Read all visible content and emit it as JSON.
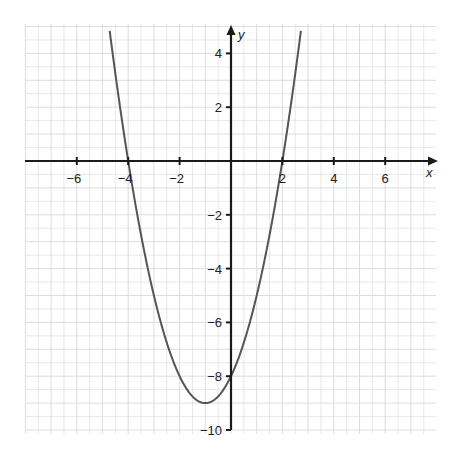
{
  "chart_data": {
    "type": "line",
    "title": "",
    "xlabel": "x",
    "ylabel": "y",
    "xlim": [
      -8,
      8
    ],
    "ylim": [
      -10,
      5
    ],
    "grid": true,
    "minor_grid_step": 0.5,
    "x_ticks": [
      -6,
      -4,
      -2,
      2,
      4,
      6
    ],
    "y_ticks": [
      4,
      2,
      -2,
      -4,
      -6,
      -8,
      -10
    ],
    "x_tick_labels": [
      "−6",
      "−4",
      "−2",
      "2",
      "4",
      "6"
    ],
    "y_tick_labels": [
      "4",
      "2",
      "−2",
      "−4",
      "−6",
      "−8",
      "−10"
    ],
    "series": [
      {
        "name": "parabola",
        "equation": "y = x^2 + 2x - 8",
        "x_intercepts": [
          -4,
          2
        ],
        "y_intercept": -8,
        "vertex": [
          -1,
          -9
        ],
        "x": [
          -4.9,
          -4,
          -3,
          -2,
          -1,
          0,
          1,
          2,
          2.8
        ],
        "values": [
          4.21,
          0,
          -5,
          -8,
          -9,
          -8,
          -5,
          0,
          5.44
        ]
      }
    ],
    "colors": {
      "curve": "#555555",
      "axis": "#1a1a1a",
      "grid": "#d9d9d9"
    }
  }
}
